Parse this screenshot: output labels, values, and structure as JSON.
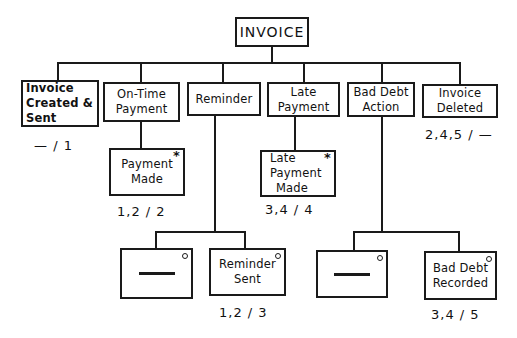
{
  "root": {
    "label": "INVOICE"
  },
  "level1": [
    {
      "lines": [
        "Invoice",
        "Created &",
        "Sent"
      ],
      "label": "— / 1"
    },
    {
      "lines": [
        "On-Time",
        "Payment"
      ]
    },
    {
      "lines": [
        "Reminder"
      ]
    },
    {
      "lines": [
        "Late",
        "Payment"
      ]
    },
    {
      "lines": [
        "Bad Debt",
        "Action"
      ]
    },
    {
      "lines": [
        "Invoice",
        "Deleted"
      ],
      "label": "2,4,5 / —"
    }
  ],
  "level2": [
    {
      "lines": [
        "Payment",
        "Made"
      ],
      "marker": "*",
      "label": "1,2 / 2"
    },
    {
      "lines": [
        "Late",
        "Payment",
        "Made"
      ],
      "marker": "*",
      "label": "3,4 / 4"
    }
  ],
  "level3": [
    {
      "lines": [
        "—"
      ],
      "marker": "o",
      "null_component": true
    },
    {
      "lines": [
        "Reminder",
        "Sent"
      ],
      "marker": "o",
      "label": "1,2 / 3"
    },
    {
      "lines": [
        "—"
      ],
      "marker": "o",
      "null_component": true
    },
    {
      "lines": [
        "Bad Debt",
        "Recorded"
      ],
      "marker": "o",
      "label": "3,4 / 5"
    }
  ]
}
